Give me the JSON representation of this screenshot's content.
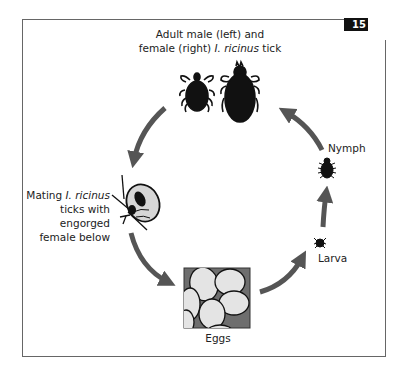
{
  "figure": {
    "number": "15",
    "colors": {
      "arrow": "#555555",
      "tick": "#111111",
      "engorged_body": "#d6d6d6",
      "egg_fill": "#e4e4e4",
      "egg_background": "#6e6e6e",
      "frame": "#666666"
    }
  },
  "stages": {
    "adults": {
      "title_line1": "Adult male (left) and",
      "title_line2_plain": "female (right) ",
      "title_line2_italic": "I. ricinus",
      "title_line2_end": " tick",
      "icons": [
        "male-tick-icon",
        "female-tick-icon"
      ]
    },
    "mating": {
      "line1_plain": "Mating ",
      "line1_italic": "I. ricinus",
      "line2": "ticks with",
      "line3": "engorged",
      "line4": "female below",
      "icon": "mating-ticks-icon"
    },
    "eggs": {
      "label": "Eggs",
      "icon": "eggs-cluster-icon"
    },
    "larva": {
      "label": "Larva",
      "icon": "larva-tick-icon"
    },
    "nymph": {
      "label": "Nymph",
      "icon": "nymph-tick-icon"
    }
  },
  "cycle_arrows": [
    {
      "from": "adults",
      "to": "mating"
    },
    {
      "from": "mating",
      "to": "eggs"
    },
    {
      "from": "eggs",
      "to": "larva"
    },
    {
      "from": "larva",
      "to": "nymph"
    },
    {
      "from": "nymph",
      "to": "adults"
    }
  ]
}
